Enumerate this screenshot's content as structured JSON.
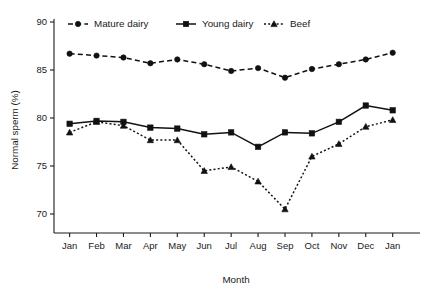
{
  "chart_data": {
    "type": "line",
    "title": "",
    "xlabel": "Month",
    "ylabel": "Normal sperm (%)",
    "categories": [
      "Jan",
      "Feb",
      "Mar",
      "Apr",
      "May",
      "Jun",
      "Jul",
      "Aug",
      "Sep",
      "Oct",
      "Nov",
      "Dec",
      "Jan"
    ],
    "x_tick_labels": [
      "Jan",
      "Feb",
      "Mar",
      "Apr",
      "May",
      "Jun",
      "Jul",
      "Aug",
      "Sep",
      "Oct",
      "Nov",
      "Dec",
      "Jan"
    ],
    "y_tick_labels": [
      "90",
      "85",
      "80",
      "75",
      "70"
    ],
    "y_ticks": [
      90,
      85,
      80,
      75,
      70
    ],
    "ylim": [
      68.5,
      90.5
    ],
    "grid": false,
    "legend_position": "top-inside",
    "series": [
      {
        "name": "Mature dairy",
        "marker": "circle",
        "linestyle": "dashed",
        "color": "#111111",
        "values": [
          86.7,
          86.5,
          86.3,
          85.7,
          86.1,
          85.6,
          84.9,
          85.2,
          84.2,
          85.1,
          85.6,
          86.1,
          86.8
        ]
      },
      {
        "name": "Young dairy",
        "marker": "square",
        "linestyle": "solid",
        "color": "#111111",
        "values": [
          79.4,
          79.7,
          79.6,
          79.0,
          78.9,
          78.3,
          78.5,
          77.0,
          78.5,
          78.4,
          79.6,
          81.3,
          80.8
        ]
      },
      {
        "name": "Beef",
        "marker": "triangle",
        "linestyle": "dotted",
        "color": "#111111",
        "values": [
          78.5,
          79.6,
          79.2,
          77.7,
          77.7,
          74.5,
          74.9,
          73.4,
          70.5,
          76.0,
          77.3,
          79.1,
          79.8
        ]
      }
    ]
  },
  "legend": {
    "items": [
      {
        "label": "Mature dairy"
      },
      {
        "label": "Young dairy"
      },
      {
        "label": "Beef"
      }
    ]
  }
}
